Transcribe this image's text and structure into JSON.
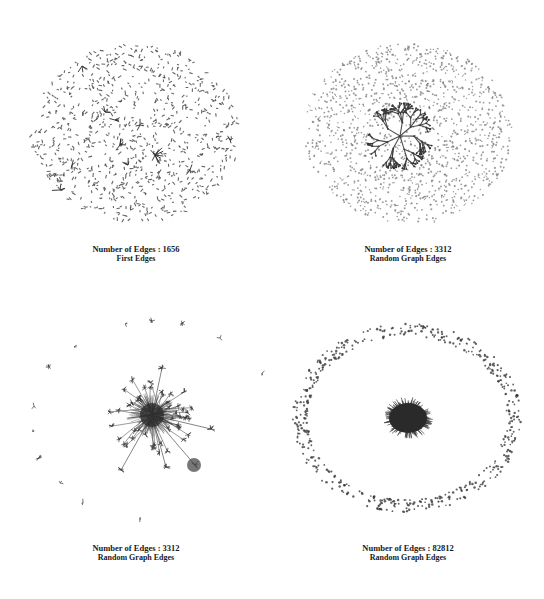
{
  "figure": {
    "panels": [
      {
        "id": "first-edges",
        "edge_count_label": "Number of Edges : 1656",
        "subtitle": "First Edges",
        "edges": 1656,
        "layout": "dispersed small components filling ellipse, few small star clusters near center"
      },
      {
        "id": "random-edges-3312-a",
        "edge_count_label": "Number of Edges : 3312",
        "subtitle": "Random Graph Edges",
        "edges": 3312,
        "layout": "dense ellipse of small components with a central branching tree component"
      },
      {
        "id": "random-edges-3312-b",
        "edge_count_label": "Number of Edges : 3312",
        "subtitle": "Random Graph Edges",
        "edges": 3312,
        "layout": "central dense hub-and-spoke cluster with small satellite clusters on a ring"
      },
      {
        "id": "random-edges-82812",
        "edge_count_label": "Number of Edges : 82812",
        "subtitle": "Random Graph Edges",
        "edges": 82812,
        "layout": "single dense central blob surrounded by a ring of isolated nodes"
      }
    ],
    "colors": {
      "node": "#4a4a4a",
      "edge": "#6b6b6b",
      "dense": "#2a2a2a",
      "text": "#1a1a1a",
      "background": "#ffffff"
    }
  }
}
